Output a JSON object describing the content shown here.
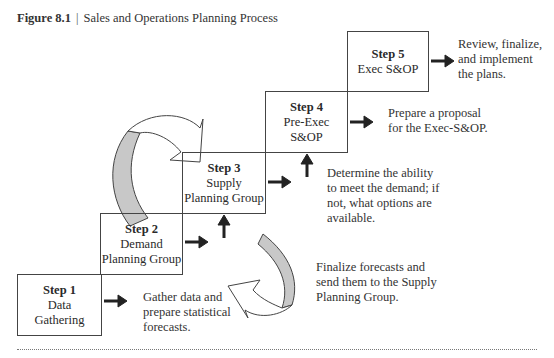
{
  "caption": {
    "figure_label": "Figure 8.1",
    "separator": "|",
    "title": "Sales and Operations Planning Process"
  },
  "steps": [
    {
      "step": "Step 1",
      "name": "Data\nGathering",
      "description": "Gather data and\nprepare statistical\nforecasts."
    },
    {
      "step": "Step 2",
      "name": "Demand\nPlanning Group",
      "description": "Finalize forecasts and\nsend them to the Supply\nPlanning Group."
    },
    {
      "step": "Step 3",
      "name": "Supply\nPlanning Group",
      "description": "Determine the ability\nto meet the demand; if\nnot, what options are\navailable."
    },
    {
      "step": "Step 4",
      "name": "Pre-Exec\nS&OP",
      "description": "Prepare a proposal\nfor the Exec-S&OP."
    },
    {
      "step": "Step 5",
      "name": "Exec S&OP",
      "description": "Review, finalize,\nand implement\nthe plans."
    }
  ],
  "colors": {
    "box_border": "#444444",
    "curved_arrow_fill": "#c8c8c8",
    "arrow": "#222222"
  }
}
